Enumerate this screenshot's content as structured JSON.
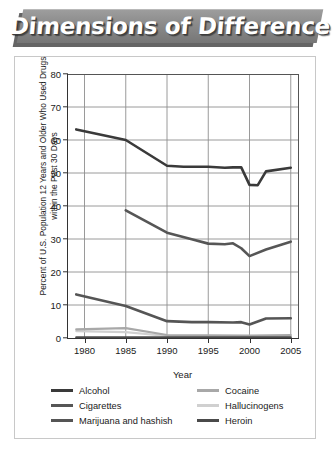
{
  "banner": {
    "title": "Dimensions of Difference"
  },
  "chart_data": {
    "type": "line",
    "title": "",
    "xlabel": "Year",
    "ylabel": "Percent of U.S. Population 12 Years and Older Who Used Drugs within the Past 30 Days",
    "xlim": [
      1978,
      2006
    ],
    "ylim": [
      0,
      80
    ],
    "xticks": [
      1980,
      1985,
      1990,
      1995,
      2000,
      2005
    ],
    "xtick_labels": [
      "1980",
      "1985",
      "1990",
      "1995",
      "2000",
      "2005"
    ],
    "yticks": [
      0,
      10,
      20,
      30,
      40,
      50,
      60,
      70,
      80
    ],
    "ytick_labels": [
      "0",
      "10",
      "20",
      "30",
      "40",
      "50",
      "60",
      "70",
      "80"
    ],
    "grid": "both",
    "grid_color": "#8f8f8f",
    "legend_position": "below",
    "series": [
      {
        "name": "Alcohol",
        "color": "#3a3a3a",
        "width": 2.6,
        "x": [
          1979,
          1985,
          1990,
          1992,
          1995,
          1997,
          1998,
          1999,
          2000,
          2001,
          2002,
          2005
        ],
        "values": [
          63.2,
          60.0,
          52.2,
          51.9,
          51.9,
          51.6,
          51.7,
          51.7,
          46.4,
          46.3,
          50.5,
          51.6
        ]
      },
      {
        "name": "Cigarettes",
        "color": "#565656",
        "width": 2.6,
        "x": [
          1985,
          1990,
          1993,
          1995,
          1997,
          1998,
          1999,
          2000,
          2002,
          2005
        ],
        "values": [
          38.7,
          31.9,
          29.9,
          28.6,
          28.4,
          28.7,
          27.2,
          24.8,
          26.8,
          29.2
        ]
      },
      {
        "name": "Marijuana and hashish",
        "color": "#555555",
        "width": 2.6,
        "x": [
          1979,
          1985,
          1990,
          1993,
          1995,
          1998,
          1999,
          2000,
          2002,
          2005
        ],
        "values": [
          13.2,
          9.7,
          5.1,
          4.8,
          4.8,
          4.7,
          4.8,
          4.1,
          5.9,
          6.0
        ]
      },
      {
        "name": "Cocaine",
        "color": "#a8a8a8",
        "width": 2.2,
        "x": [
          1979,
          1985,
          1990,
          1995,
          2000,
          2005
        ],
        "values": [
          2.6,
          3.0,
          0.9,
          0.8,
          0.7,
          0.9
        ]
      },
      {
        "name": "Hallucinogens",
        "color": "#d0d0d0",
        "width": 2.2,
        "x": [
          1979,
          1985,
          1990,
          1995,
          2000,
          2005
        ],
        "values": [
          2.1,
          1.8,
          0.6,
          0.6,
          0.6,
          0.5
        ]
      },
      {
        "name": "Heroin",
        "color": "#4a4a4a",
        "width": 2.2,
        "x": [
          1979,
          1985,
          1990,
          1995,
          2000,
          2005
        ],
        "values": [
          0.2,
          0.2,
          0.2,
          0.2,
          0.2,
          0.2
        ]
      }
    ]
  },
  "legend": {
    "rows": [
      {
        "left": {
          "label": "Alcohol",
          "color": "#3a3a3a"
        },
        "right": {
          "label": "Cocaine",
          "color": "#a8a8a8"
        }
      },
      {
        "left": {
          "label": "Cigarettes",
          "color": "#565656"
        },
        "right": {
          "label": "Hallucinogens",
          "color": "#d0d0d0"
        }
      },
      {
        "left": {
          "label": "Marijuana and hashish",
          "color": "#555555"
        },
        "right": {
          "label": "Heroin",
          "color": "#4a4a4a"
        }
      }
    ]
  }
}
